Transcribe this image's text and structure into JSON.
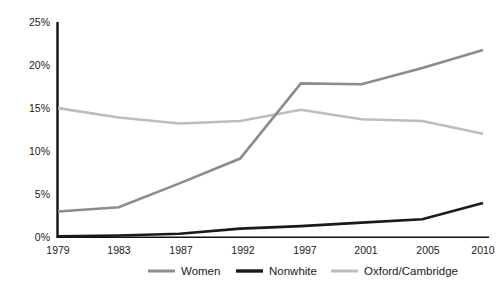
{
  "chart_data": {
    "type": "line",
    "title": "",
    "subtitle": "",
    "xlabel": "",
    "ylabel": "",
    "categories": [
      "1979",
      "1983",
      "1987",
      "1992",
      "1997",
      "2001",
      "2005",
      "2010"
    ],
    "x_tick_labels": [
      "1979",
      "1983",
      "1987",
      "1992",
      "1997",
      "2001",
      "2005",
      "2010"
    ],
    "y_tick_labels": [
      "0%",
      "5%",
      "10%",
      "15%",
      "20%",
      "25%"
    ],
    "y_tick_values": [
      0,
      5,
      10,
      15,
      20,
      25
    ],
    "ylim": [
      0,
      25
    ],
    "grid": false,
    "legend_position": "bottom",
    "series": [
      {
        "name": "Women",
        "color": "#8c8c8c",
        "width": 2.6,
        "values": [
          3.0,
          3.5,
          6.3,
          9.2,
          18.0,
          17.9,
          19.8,
          21.9
        ]
      },
      {
        "name": "Nonwhite",
        "color": "#1a1a1a",
        "width": 2.6,
        "values": [
          0.1,
          0.2,
          0.4,
          1.0,
          1.3,
          1.7,
          2.1,
          4.0
        ]
      },
      {
        "name": "Oxford/Cambridge",
        "color": "#bdbdbd",
        "width": 2.6,
        "values": [
          15.1,
          14.0,
          13.3,
          13.6,
          14.9,
          13.8,
          13.6,
          12.1
        ]
      }
    ]
  },
  "legend": {
    "items": [
      {
        "label": "Women",
        "color": "#8c8c8c"
      },
      {
        "label": "Nonwhite",
        "color": "#1a1a1a"
      },
      {
        "label": "Oxford/Cambridge",
        "color": "#bdbdbd"
      }
    ]
  },
  "axes": {
    "y_axis_color": "#111111",
    "x_axis_color": "#111111"
  }
}
